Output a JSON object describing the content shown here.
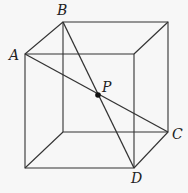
{
  "diagram": {
    "type": "cube-with-space-diagonals",
    "labels": {
      "A": "A",
      "B": "B",
      "C": "C",
      "D": "D",
      "P": "P"
    },
    "line_color": "#333333",
    "background": "#f7f7f7",
    "vertices": {
      "A": [
        25,
        54
      ],
      "B": [
        63,
        22
      ],
      "C": [
        168,
        132
      ],
      "D": [
        134,
        168
      ],
      "P": [
        98,
        95
      ]
    },
    "segments": [
      "A-C",
      "B-D"
    ]
  }
}
